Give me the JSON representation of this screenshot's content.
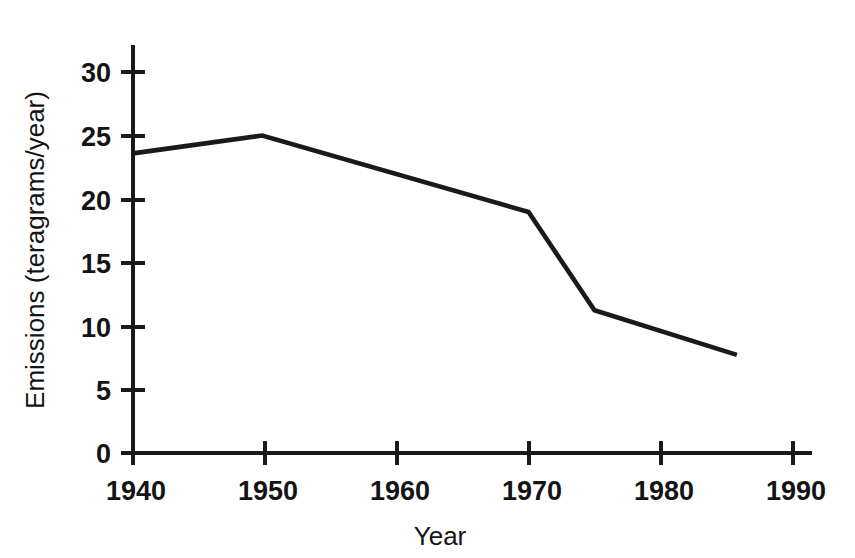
{
  "chart_data": {
    "type": "line",
    "title": "",
    "xlabel": "Year",
    "ylabel": "Emissions (teragrams/year)",
    "xlim": [
      1940,
      1991.5
    ],
    "ylim": [
      0,
      32
    ],
    "xticks": [
      1940,
      1950,
      1960,
      1970,
      1980,
      1990
    ],
    "xtick_labels": [
      "1940",
      "1950",
      "1960",
      "1970",
      "1980",
      "1990"
    ],
    "yticks": [
      0,
      5,
      10,
      15,
      20,
      25,
      30
    ],
    "ytick_labels": [
      "0",
      "5",
      "10",
      "15",
      "20",
      "25",
      "30"
    ],
    "grid": false,
    "legend": false,
    "series": [
      {
        "name": "Emissions",
        "color": "#1a1a1a",
        "x": [
          1940,
          1949.8,
          1970,
          1975,
          1985.8
        ],
        "values": [
          23.5,
          24.9,
          18.9,
          11.2,
          7.7
        ]
      }
    ]
  },
  "axes": {
    "x_title": "Year",
    "y_title": "Emissions (teragrams/year)"
  },
  "colors": {
    "line": "#1a1a1a",
    "axis": "#1a1a1a",
    "background": "#ffffff",
    "text": "#141414"
  }
}
